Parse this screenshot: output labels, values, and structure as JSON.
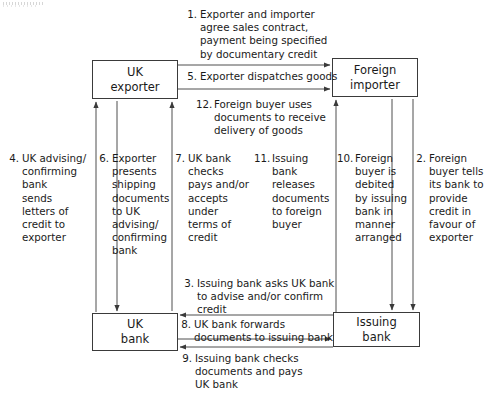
{
  "diagram": {
    "type": "flow-diagram",
    "colors": {
      "line": "#3a3a3a",
      "text": "#1a1a1a",
      "background": "#ffffff"
    },
    "nodes": [
      {
        "id": "uk-exporter",
        "line1": "UK",
        "line2": "exporter"
      },
      {
        "id": "foreign-importer",
        "line1": "Foreign",
        "line2": "importer"
      },
      {
        "id": "uk-bank",
        "line1": "UK",
        "line2": "bank"
      },
      {
        "id": "issuing-bank",
        "line1": "Issuing",
        "line2": "bank"
      }
    ],
    "steps": [
      {
        "number": "1.",
        "from": "uk-exporter",
        "to": "foreign-importer",
        "lines": [
          "Exporter and importer",
          "agree sales contract,",
          "payment being specified",
          "by documentary credit"
        ]
      },
      {
        "number": "2.",
        "from": "foreign-importer",
        "to": "issuing-bank",
        "lines": [
          "Foreign",
          "buyer tells",
          "its bank to",
          "provide",
          "credit in",
          "favour of",
          "exporter"
        ]
      },
      {
        "number": "3.",
        "from": "issuing-bank",
        "to": "uk-bank",
        "lines": [
          "Issuing bank asks UK bank",
          "to advise and/or confirm",
          "credit"
        ]
      },
      {
        "number": "4.",
        "from": "uk-bank",
        "to": "uk-exporter",
        "lines": [
          "UK advising/",
          "confirming",
          "bank",
          "sends",
          "letters of",
          "credit to",
          "exporter"
        ]
      },
      {
        "number": "5.",
        "from": "uk-exporter",
        "to": "foreign-importer",
        "lines": [
          "Exporter dispatches goods"
        ]
      },
      {
        "number": "6.",
        "from": "uk-exporter",
        "to": "uk-bank",
        "lines": [
          "Exporter",
          "presents",
          "shipping",
          "documents",
          "to UK",
          "advising/",
          "confirming",
          "bank"
        ]
      },
      {
        "number": "7.",
        "from": "uk-bank",
        "to": "uk-exporter",
        "lines": [
          "UK bank",
          "checks",
          "pays and/or",
          "accepts",
          "under",
          "terms of",
          "credit"
        ]
      },
      {
        "number": "8.",
        "from": "uk-bank",
        "to": "issuing-bank",
        "lines": [
          "UK bank forwards",
          "documents to issuing bank"
        ]
      },
      {
        "number": "9.",
        "from": "issuing-bank",
        "to": "uk-bank",
        "lines": [
          "Issuing bank checks",
          "documents and pays",
          "UK bank"
        ]
      },
      {
        "number": "10.",
        "from": "issuing-bank",
        "to": "foreign-importer",
        "lines": [
          "Foreign",
          "buyer is",
          "debited",
          "by issuing",
          "bank in",
          "manner",
          "arranged"
        ]
      },
      {
        "number": "11.",
        "from": "issuing-bank",
        "to": "foreign-importer",
        "lines": [
          "Issuing",
          "bank",
          "releases",
          "documents",
          "to foreign",
          "buyer"
        ]
      },
      {
        "number": "12.",
        "from": "uk-exporter",
        "to": "foreign-importer",
        "lines": [
          "Foreign buyer uses",
          "documents to receive",
          "delivery of goods"
        ]
      }
    ]
  }
}
